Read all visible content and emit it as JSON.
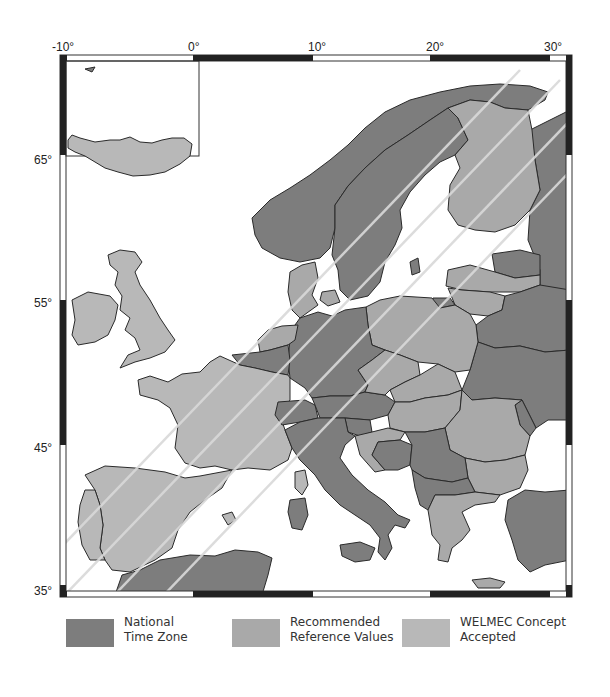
{
  "map": {
    "title": "",
    "region": "Europe",
    "longitude_ticks": [
      "-10°",
      "0°",
      "10°",
      "20°",
      "30°"
    ],
    "latitude_ticks": [
      "65°",
      "55°",
      "45°",
      "35°"
    ],
    "inset": "Iceland"
  },
  "legend": {
    "items": [
      {
        "label_line1": "National",
        "label_line2": "Time Zone",
        "color": "#7d7d7d"
      },
      {
        "label_line1": "Recommended",
        "label_line2": "Reference Values",
        "color": "#a9a9a9"
      },
      {
        "label_line1": "WELMEC Concept",
        "label_line2": "Accepted",
        "color": "#b8b8b8"
      }
    ]
  },
  "colors": {
    "national_time_zone": "#7d7d7d",
    "recommended_reference_values": "#a9a9a9",
    "welmec_concept_accepted": "#b8b8b8",
    "sea": "#ffffff",
    "border": "#2a2a2a",
    "stripe": "#d9d9d9"
  },
  "regions": {
    "national_time_zone": [
      "Norway",
      "Sweden",
      "Germany",
      "Belgium",
      "Luxembourg",
      "Switzerland",
      "Austria",
      "Italy",
      "Sardinia",
      "Sicily",
      "Estonia",
      "Belarus",
      "Ukraine",
      "Moldova",
      "Russia",
      "Kaliningrad",
      "Slovenia",
      "Bosnia",
      "Serbia",
      "Montenegro",
      "Albania",
      "Macedonia",
      "Turkey",
      "Morocco",
      "Algeria",
      "Tunisia"
    ],
    "recommended_reference_values": [
      "Finland",
      "Poland",
      "Czech Republic",
      "Slovakia",
      "Hungary",
      "Romania",
      "Bulgaria",
      "Greece",
      "Latvia",
      "Lithuania",
      "Denmark",
      "Netherlands",
      "Croatia"
    ],
    "welmec_concept_accepted": [
      "United Kingdom",
      "Ireland",
      "Iceland",
      "France",
      "Spain",
      "Portugal",
      "Corsica"
    ]
  }
}
